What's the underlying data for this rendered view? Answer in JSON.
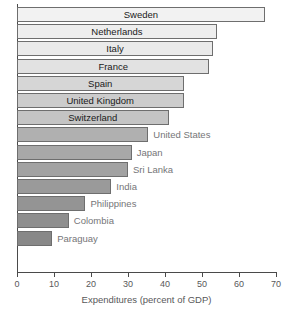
{
  "chart_data": {
    "type": "bar",
    "orientation": "horizontal",
    "title": "",
    "xlabel": "Expenditures (percent of GDP)",
    "ylabel": "",
    "xlim": [
      0,
      70
    ],
    "xticks": [
      0,
      10,
      20,
      30,
      40,
      50,
      60,
      70
    ],
    "xtick_labels": [
      "0",
      "10",
      "20",
      "30",
      "40",
      "50",
      "60",
      "70"
    ],
    "grid": false,
    "legend": "none",
    "categories": [
      "Sweden",
      "Netherlands",
      "Italy",
      "France",
      "Spain",
      "United Kingdom",
      "Switzerland",
      "United States",
      "Japan",
      "Sri Lanka",
      "India",
      "Philippines",
      "Colombia",
      "Paraguay"
    ],
    "values": [
      67,
      54,
      53,
      52,
      45,
      45,
      41,
      35.5,
      31,
      30,
      25.5,
      18.5,
      14,
      9.5
    ],
    "bars": [
      {
        "label": "Sweden",
        "value": 67,
        "fill": "#f2f2f2",
        "label_position": "inside"
      },
      {
        "label": "Netherlands",
        "value": 54,
        "fill": "#eeeeee",
        "label_position": "inside"
      },
      {
        "label": "Italy",
        "value": 53,
        "fill": "#eaeaea",
        "label_position": "inside"
      },
      {
        "label": "France",
        "value": 52,
        "fill": "#e2e2e2",
        "label_position": "inside"
      },
      {
        "label": "Spain",
        "value": 45,
        "fill": "#d6d6d6",
        "label_position": "inside"
      },
      {
        "label": "United Kingdom",
        "value": 45,
        "fill": "#cccccc",
        "label_position": "inside"
      },
      {
        "label": "Switzerland",
        "value": 41,
        "fill": "#c4c4c4",
        "label_position": "inside"
      },
      {
        "label": "United States",
        "value": 35.5,
        "fill": "#b0b0b0",
        "label_position": "outside"
      },
      {
        "label": "Japan",
        "value": 31,
        "fill": "#a8a8a8",
        "label_position": "outside"
      },
      {
        "label": "Sri Lanka",
        "value": 30,
        "fill": "#a2a2a2",
        "label_position": "outside"
      },
      {
        "label": "India",
        "value": 25.5,
        "fill": "#9a9a9a",
        "label_position": "outside"
      },
      {
        "label": "Philippines",
        "value": 18.5,
        "fill": "#949494",
        "label_position": "outside"
      },
      {
        "label": "Colombia",
        "value": 14,
        "fill": "#8e8e8e",
        "label_position": "outside"
      },
      {
        "label": "Paraguay",
        "value": 9.5,
        "fill": "#888888",
        "label_position": "outside"
      }
    ],
    "colors": {
      "axis": "#4a4a4a",
      "bar_border": "#6e6e6e",
      "inside_label_text": "#1a1a1a",
      "outside_label_text": "#757578",
      "tick_text": "#58585a",
      "background": "#ffffff"
    }
  }
}
